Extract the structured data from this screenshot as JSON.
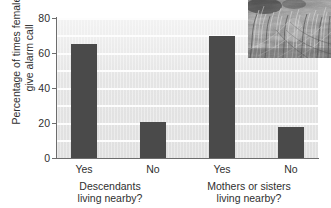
{
  "chart_data": {
    "type": "bar",
    "title": "",
    "subtitle": "",
    "xlabel": "",
    "ylabel": "Percentage of times females give alarm call",
    "ylabel_line1": "Percentage of times females",
    "ylabel_line2": "give alarm call",
    "ylim": [
      0,
      80
    ],
    "yticks": [
      0,
      20,
      40,
      60,
      80
    ],
    "ytick_labels": [
      "0",
      "20",
      "40",
      "60",
      "80"
    ],
    "grid": "horizontal",
    "legend": "none",
    "categories": [
      "Yes",
      "No",
      "Yes",
      "No"
    ],
    "values": [
      65,
      20.5,
      70,
      18
    ],
    "groups": [
      {
        "label_line1": "Descendants",
        "label_line2": "living nearby?",
        "categories": [
          "Yes",
          "No"
        ],
        "values": [
          65,
          20.5
        ]
      },
      {
        "label_line1": "Mothers or sisters",
        "label_line2": "living nearby?",
        "categories": [
          "Yes",
          "No"
        ],
        "values": [
          70,
          18
        ]
      }
    ],
    "bar_color": "#4a4a4a",
    "plot_background": "#e8e8e8",
    "gridline_color": "#fdfdfd",
    "axis_color": "#6d6d6d"
  },
  "inset": {
    "name": "grass-habitat-photograph",
    "description": "Grayscale photograph of dense grass vegetation"
  }
}
